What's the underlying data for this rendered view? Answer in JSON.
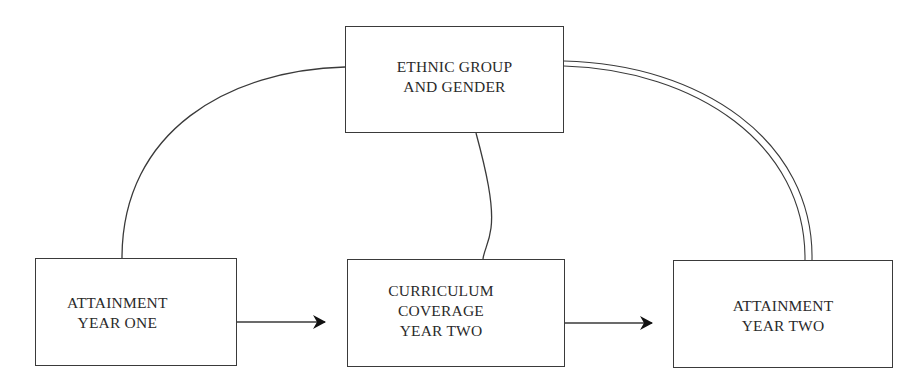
{
  "diagram": {
    "type": "path-model",
    "nodes": [
      {
        "id": "ethnic_gender",
        "label": "ETHNIC GROUP\nAND GENDER"
      },
      {
        "id": "attainment_y1",
        "label": "ATTAINMENT\nYEAR ONE"
      },
      {
        "id": "curriculum_y2",
        "label": "CURRICULUM\nCOVERAGE\nYEAR TWO"
      },
      {
        "id": "attainment_y2",
        "label": "ATTAINMENT\nYEAR TWO"
      }
    ],
    "edges": [
      {
        "from": "attainment_y1",
        "to": "curriculum_y2",
        "style": "arrow"
      },
      {
        "from": "curriculum_y2",
        "to": "attainment_y2",
        "style": "arrow"
      },
      {
        "from": "ethnic_gender",
        "to": "attainment_y1",
        "style": "single-curve"
      },
      {
        "from": "ethnic_gender",
        "to": "curriculum_y2",
        "style": "single-curve"
      },
      {
        "from": "ethnic_gender",
        "to": "attainment_y2",
        "style": "double-curve"
      }
    ],
    "colors": {
      "line": "#3a3a3a",
      "text": "#2a2a2a",
      "background": "#ffffff"
    }
  }
}
